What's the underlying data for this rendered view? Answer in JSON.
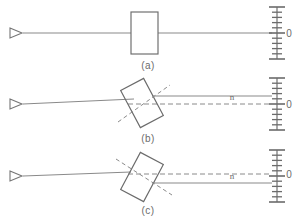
{
  "figure": {
    "kind": "optics-ray-diagram",
    "background_color": "#ffffff",
    "line_color": "#808080",
    "width": 307,
    "height": 222
  },
  "panels": [
    {
      "id": "a",
      "caption": "(a)",
      "caption_x": 148,
      "caption_y": 69,
      "axis_y": 33,
      "description": "Beam passes straight through an un-tilted plate",
      "plate": {
        "type": "upright-rectangle",
        "x": 131,
        "y": 12,
        "width": 27,
        "height": 42,
        "tilt_deg": 0
      },
      "source": {
        "x": 10,
        "y": 33,
        "size": 12,
        "label": "laser-source"
      },
      "incident_beam": {
        "x1": 23,
        "y1": 33,
        "x2": 131,
        "y2": 33
      },
      "exit_beam": {
        "x1": 158,
        "y1": 33,
        "x2": 272,
        "y2": 33
      },
      "dashed_axis": null,
      "normal_line": null,
      "beam_offset": 0,
      "scale_label": "0",
      "scale_label_x": 289,
      "scale_label_y": 37,
      "n_label": null
    },
    {
      "id": "b",
      "caption": "(b)",
      "caption_x": 148,
      "caption_y": 142,
      "axis_y": 104,
      "description": "Plate tilted counter-clockwise; exit beam displaced upward",
      "plate": {
        "type": "tilted-rectangle",
        "cx": 142,
        "cy": 103,
        "width": 26,
        "height": 42,
        "tilt_deg": -28
      },
      "source": {
        "x": 10,
        "y": 104,
        "size": 12,
        "label": "laser-source"
      },
      "incident_beam": {
        "x1": 23,
        "y1": 104,
        "x2": 134,
        "y2": 99
      },
      "exit_beam": {
        "x1": 152,
        "y1": 96,
        "x2": 272,
        "y2": 96
      },
      "dashed_axis": {
        "x1": 128,
        "y1": 104,
        "x2": 272,
        "y2": 104
      },
      "normal_line": {
        "x1": 118,
        "y1": 122,
        "x2": 170,
        "y2": 85
      },
      "beam_offset": -8,
      "scale_label": "0",
      "scale_label_x": 289,
      "scale_label_y": 108,
      "n_label": "n",
      "n_label_x": 232,
      "n_label_y": 100
    },
    {
      "id": "c",
      "caption": "(c)",
      "caption_x": 148,
      "caption_y": 214,
      "axis_y": 176,
      "description": "Plate tilted clockwise; exit beam displaced downward",
      "plate": {
        "type": "tilted-rectangle",
        "cx": 142,
        "cy": 177,
        "width": 26,
        "height": 42,
        "tilt_deg": 28
      },
      "source": {
        "x": 10,
        "y": 176,
        "size": 12,
        "label": "laser-source"
      },
      "incident_beam": {
        "x1": 23,
        "y1": 176,
        "x2": 131,
        "y2": 172
      },
      "exit_beam": {
        "x1": 152,
        "y1": 183,
        "x2": 272,
        "y2": 183
      },
      "dashed_axis": {
        "x1": 128,
        "y1": 174,
        "x2": 272,
        "y2": 174
      },
      "normal_line": {
        "x1": 116,
        "y1": 159,
        "x2": 172,
        "y2": 195
      },
      "beam_offset": 8,
      "scale_label": "0",
      "scale_label_x": 289,
      "scale_label_y": 178,
      "n_label": "n",
      "n_label_x": 232,
      "n_label_y": 179
    }
  ],
  "scale": {
    "name": "measuring-ruler",
    "x": 277,
    "half_height": 26,
    "tick_long_half_width": 8,
    "tick_short_half_width": 5,
    "tick_count": 11,
    "tick_spacing": 5.2,
    "long_tick_indices": [
      0,
      5,
      10
    ],
    "zero_label": "0"
  },
  "labels": {
    "panel_a": "(a)",
    "panel_b": "(b)",
    "panel_c": "(c)",
    "normal_symbol": "n",
    "zero_symbol": "0"
  }
}
